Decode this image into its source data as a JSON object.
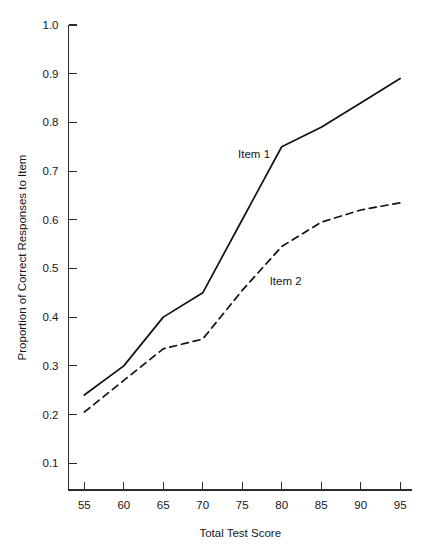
{
  "figure": {
    "background_color": "#ffffff",
    "line_color": "#111111",
    "text_color": "#161616"
  },
  "chart_data": {
    "type": "line",
    "title": "",
    "subtitle": "",
    "xlabel": "Total Test Score",
    "ylabel": "Proportion of Correct Responses to Item",
    "x": [
      55,
      60,
      65,
      70,
      75,
      80,
      85,
      90,
      95
    ],
    "xlim": [
      53,
      96.5
    ],
    "ylim": [
      0.045,
      1.0
    ],
    "xticks": [
      55,
      60,
      65,
      70,
      75,
      80,
      85,
      90,
      95
    ],
    "xticklabels": [
      "55",
      "60",
      "65",
      "70",
      "75",
      "80",
      "85",
      "90",
      "95"
    ],
    "yticks": [
      0.1,
      0.2,
      0.3,
      0.4,
      0.5,
      0.6,
      0.7,
      0.8,
      0.9,
      1.0
    ],
    "yticklabels": [
      "0.1",
      "0.2",
      "0.3",
      "0.4",
      "0.5",
      "0.6",
      "0.7",
      "0.8",
      "0.9",
      "1.0"
    ],
    "grid": false,
    "legend_position": "inline-annotation",
    "series": [
      {
        "name": "Item 1",
        "style": "solid",
        "color": "#111111",
        "values": [
          0.24,
          0.3,
          0.4,
          0.45,
          0.6,
          0.75,
          0.79,
          0.84,
          0.89
        ],
        "annotation": {
          "text": "Item 1",
          "x": 76.5,
          "y": 0.735
        }
      },
      {
        "name": "Item 2",
        "style": "dashed",
        "color": "#111111",
        "values": [
          0.205,
          0.27,
          0.335,
          0.355,
          0.455,
          0.545,
          0.595,
          0.62,
          0.635
        ],
        "annotation": {
          "text": "Item 2",
          "x": 80.5,
          "y": 0.475
        }
      }
    ]
  }
}
